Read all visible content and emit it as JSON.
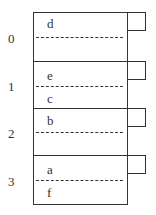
{
  "diagram": {
    "type": "hash-table-buckets",
    "buckets": [
      {
        "index": "0",
        "upper": "d",
        "lower": ""
      },
      {
        "index": "1",
        "upper": "e",
        "lower": "c"
      },
      {
        "index": "2",
        "upper": "b",
        "lower": ""
      },
      {
        "index": "3",
        "upper": "a",
        "lower": "f"
      }
    ]
  }
}
